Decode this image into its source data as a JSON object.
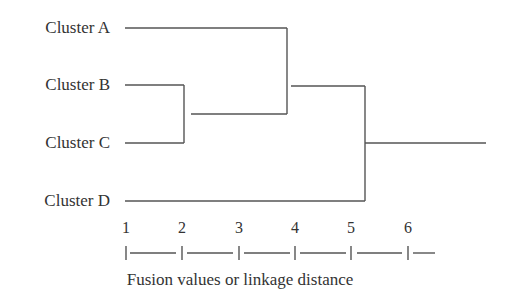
{
  "diagram": {
    "type": "dendrogram",
    "leaves": [
      {
        "id": "A",
        "label": "Cluster A"
      },
      {
        "id": "B",
        "label": "Cluster B"
      },
      {
        "id": "C",
        "label": "Cluster C"
      },
      {
        "id": "D",
        "label": "Cluster D"
      }
    ],
    "merges": [
      {
        "members": [
          "B",
          "C"
        ],
        "distance": 2.0
      },
      {
        "members": [
          "A",
          "BC"
        ],
        "distance": 3.9
      },
      {
        "members": [
          "ABC",
          "D"
        ],
        "distance": 5.25
      }
    ],
    "axis": {
      "ticks": [
        "1",
        "2",
        "3",
        "4",
        "5",
        "6"
      ],
      "title": "Fusion values or linkage distance"
    },
    "line_color": "#555555",
    "text_color": "#333333"
  }
}
